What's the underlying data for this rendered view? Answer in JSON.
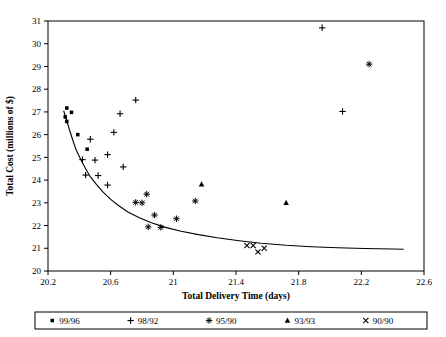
{
  "chart_data": {
    "type": "scatter",
    "title": "",
    "xlabel": "Total Delivery Time (days)",
    "ylabel": "Total Cost (millions of $)",
    "xlim": [
      20.2,
      22.6
    ],
    "ylim": [
      20,
      31
    ],
    "xticks": [
      "20.2",
      "20.6",
      "21",
      "21.4",
      "21.8",
      "22.2",
      "22.6"
    ],
    "xtick_values": [
      20.2,
      20.6,
      21.0,
      21.4,
      21.8,
      22.2,
      22.6
    ],
    "yticks": [
      "20",
      "21",
      "22",
      "23",
      "24",
      "25",
      "26",
      "27",
      "28",
      "29",
      "30",
      "31"
    ],
    "ytick_values": [
      20,
      21,
      22,
      23,
      24,
      25,
      26,
      27,
      28,
      29,
      30,
      31
    ],
    "grid": false,
    "legend_position": "below-axes",
    "series": [
      {
        "name": "99/96",
        "marker": "square",
        "points": [
          [
            20.32,
            27.17
          ],
          [
            20.35,
            26.98
          ],
          [
            20.31,
            26.78
          ],
          [
            20.32,
            26.58
          ],
          [
            20.39,
            26.0
          ],
          [
            20.45,
            25.36
          ]
        ]
      },
      {
        "name": "98/92",
        "marker": "plus",
        "points": [
          [
            20.76,
            27.52
          ],
          [
            20.66,
            26.92
          ],
          [
            20.62,
            26.1
          ],
          [
            20.47,
            25.8
          ],
          [
            20.58,
            25.12
          ],
          [
            20.42,
            24.9
          ],
          [
            20.5,
            24.88
          ],
          [
            20.68,
            24.58
          ],
          [
            20.44,
            24.22
          ],
          [
            20.52,
            24.2
          ],
          [
            20.58,
            23.78
          ],
          [
            21.95,
            30.7
          ],
          [
            22.08,
            27.02
          ]
        ]
      },
      {
        "name": "95/90",
        "marker": "asterisk",
        "points": [
          [
            20.83,
            23.38
          ],
          [
            20.76,
            23.02
          ],
          [
            20.8,
            23.0
          ],
          [
            20.88,
            22.46
          ],
          [
            21.02,
            22.3
          ],
          [
            20.84,
            21.94
          ],
          [
            20.92,
            21.92
          ],
          [
            21.14,
            23.08
          ],
          [
            22.25,
            29.1
          ]
        ]
      },
      {
        "name": "93/93",
        "marker": "triangle",
        "points": [
          [
            21.18,
            23.82
          ],
          [
            21.72,
            23.0
          ]
        ]
      },
      {
        "name": "90/90",
        "marker": "cross",
        "points": [
          [
            21.47,
            21.12
          ],
          [
            21.51,
            21.12
          ],
          [
            21.58,
            21.0
          ],
          [
            21.54,
            20.84
          ]
        ]
      }
    ],
    "fit_curve": {
      "name": "efficient-frontier",
      "style": "solid-black",
      "points": [
        [
          20.3,
          27.05
        ],
        [
          20.32,
          26.6
        ],
        [
          20.34,
          26.15
        ],
        [
          20.36,
          25.72
        ],
        [
          20.38,
          25.32
        ],
        [
          20.41,
          24.9
        ],
        [
          20.44,
          24.5
        ],
        [
          20.47,
          24.15
        ],
        [
          20.51,
          23.8
        ],
        [
          20.55,
          23.48
        ],
        [
          20.6,
          23.15
        ],
        [
          20.65,
          22.88
        ],
        [
          20.71,
          22.6
        ],
        [
          20.78,
          22.35
        ],
        [
          20.86,
          22.12
        ],
        [
          20.95,
          21.92
        ],
        [
          21.05,
          21.75
        ],
        [
          21.16,
          21.6
        ],
        [
          21.28,
          21.46
        ],
        [
          21.42,
          21.33
        ],
        [
          21.56,
          21.22
        ],
        [
          21.72,
          21.13
        ],
        [
          21.88,
          21.07
        ],
        [
          22.05,
          21.02
        ],
        [
          22.22,
          20.99
        ],
        [
          22.4,
          20.97
        ],
        [
          22.47,
          20.96
        ]
      ]
    },
    "legend": [
      {
        "marker": "square",
        "label": "99/96"
      },
      {
        "marker": "plus",
        "label": "98/92"
      },
      {
        "marker": "asterisk",
        "label": "95/90"
      },
      {
        "marker": "triangle",
        "label": "93/93"
      },
      {
        "marker": "cross",
        "label": "90/90"
      }
    ],
    "colors": {
      "ink": "#000000",
      "background": "#ffffff"
    }
  }
}
